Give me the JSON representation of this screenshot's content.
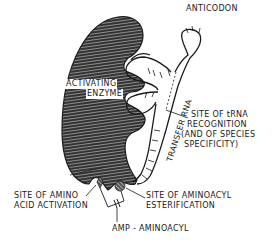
{
  "diagram": {
    "labels": {
      "anticodon": "ANTICODON",
      "enzyme_line1": "ACTIVATING",
      "enzyme_line2": "ENZYME",
      "transfer_rna": "TRANSFER RNA",
      "recognition_line1": "SITE OF tRNA",
      "recognition_line2": "RECOGNITION",
      "recognition_line3": "(AND OF SPECIES",
      "recognition_line4": "SPECIFICITY)",
      "amino_line1": "SITE OF AMINO",
      "amino_line2": "ACID ACTIVATION",
      "ester_line1": "SITE OF AMINOACYL",
      "ester_line2": "ESTERIFICATION",
      "amp": "AMP - AMINOACYL"
    },
    "colors": {
      "ink": "#1a1a1a",
      "hatch_bg": "#3a3a3a",
      "hatch_line": "#9a9a9a",
      "background": "#ffffff"
    }
  }
}
